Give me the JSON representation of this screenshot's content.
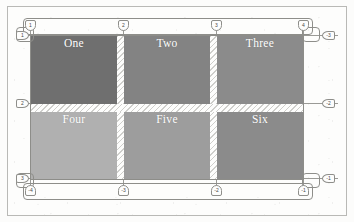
{
  "figure": {
    "kind": "css-grid-inspector-overlay",
    "columns": 3,
    "rows": 2,
    "column_gap_px": 7,
    "row_gap_px": 8
  },
  "colors": {
    "page_background": "#fcfcfb",
    "frame_border": "#b9b9b6",
    "grid_line": "#9a9a96",
    "badge_fill": "#fdfdfc",
    "badge_border": "#8e8e8a",
    "badge_text": "#4a4a47",
    "gutter": "#fdfdfc",
    "cell_text": "#ffffff",
    "cell_one": "#6f6f6f",
    "cell_two": "#838383",
    "cell_three": "#8b8b8b",
    "cell_four": "#b0b0b0",
    "cell_five": "#9d9d9d",
    "cell_six": "#8b8b8b"
  },
  "cells": [
    {
      "name": "one",
      "label": "One",
      "color": "#6f6f6f",
      "row": 1,
      "column": 1
    },
    {
      "name": "two",
      "label": "Two",
      "color": "#838383",
      "row": 1,
      "column": 2
    },
    {
      "name": "three",
      "label": "Three",
      "color": "#8b8b8b",
      "row": 1,
      "column": 3
    },
    {
      "name": "four",
      "label": "Four",
      "color": "#b0b0b0",
      "row": 2,
      "column": 1
    },
    {
      "name": "five",
      "label": "Five",
      "color": "#9d9d9d",
      "row": 2,
      "column": 2
    },
    {
      "name": "six",
      "label": "Six",
      "color": "#8b8b8b",
      "row": 2,
      "column": 3
    }
  ],
  "line_numbers": {
    "top_column_lines": [
      "1",
      "2",
      "3",
      "4"
    ],
    "bottom_column_lines": [
      "-4",
      "-3",
      "-2",
      "-1"
    ],
    "left_row_lines": [
      "1",
      "2",
      "3"
    ],
    "right_row_lines": [
      "-3",
      "-2",
      "-1"
    ]
  }
}
